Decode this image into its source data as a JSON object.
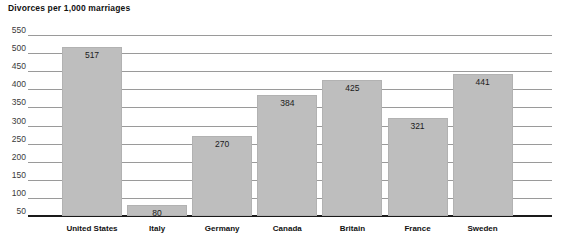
{
  "chart_data": {
    "type": "bar",
    "title": "Divorces per 1,000 marriages",
    "xlabel": "",
    "ylabel": "",
    "categories": [
      "United States",
      "Italy",
      "Germany",
      "Canada",
      "Britain",
      "France",
      "Sweden"
    ],
    "values": [
      517,
      80,
      270,
      384,
      425,
      321,
      441
    ],
    "value_labels": [
      "517",
      "80",
      "270",
      "384",
      "425",
      "321",
      "441"
    ],
    "ylim": [
      50,
      550
    ],
    "ytick_values": [
      550,
      500,
      450,
      400,
      350,
      300,
      250,
      200,
      150,
      100,
      50
    ],
    "ytick_labels": [
      "550",
      "500",
      "450",
      "400",
      "350",
      "300",
      "250",
      "200",
      "150",
      "100",
      "50"
    ],
    "grid": true,
    "legend": false,
    "legend_position": "none",
    "series": [
      {
        "name": "Divorces per 1,000 marriages",
        "values": [
          517,
          80,
          270,
          384,
          425,
          321,
          441
        ]
      }
    ]
  },
  "style": {
    "bar_fill": "#bebebe",
    "bar_border": "#b2b2b2",
    "gridline_color": "#9a9a9a",
    "axis_color": "#1a1a1a",
    "background": "#ffffff",
    "title_color": "#111111",
    "tick_color": "#3a3a3a"
  }
}
